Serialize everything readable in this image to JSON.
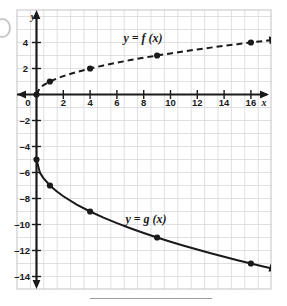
{
  "figure": {
    "kind": "coordinate-grid-graph",
    "background_color": "#ffffff",
    "grid_color": "#c9c9cf",
    "grid_border_color": "#b9b9c2",
    "axis_color": "#1a1a1a",
    "curve_color": "#1a1a1a",
    "point_color": "#1a1a1a"
  },
  "axes": {
    "x_axis_name": "x",
    "y_axis_name": "y",
    "origin_label": "0",
    "x_tick_labels": [
      "2",
      "4",
      "6",
      "8",
      "10",
      "12",
      "14",
      "16"
    ],
    "y_tick_labels": [
      "4",
      "2",
      "–2",
      "–4",
      "–6",
      "–8",
      "–10",
      "–12",
      "–14"
    ]
  },
  "labels": {
    "f_label": "y = f (x)",
    "g_label": "y = g (x)"
  },
  "chart_data": {
    "type": "line",
    "title": "",
    "xlabel": "x",
    "ylabel": "y",
    "xlim": [
      -1,
      18
    ],
    "ylim": [
      -15,
      5
    ],
    "grid": true,
    "legend": "inline-labels",
    "x_ticks": [
      0,
      2,
      4,
      6,
      8,
      10,
      12,
      14,
      16
    ],
    "y_ticks": [
      4,
      2,
      0,
      -2,
      -4,
      -6,
      -8,
      -10,
      -12,
      -14
    ],
    "x_minor_step": 1,
    "y_minor_step": 1,
    "series": [
      {
        "name": "y = f (x)",
        "style": "dashed",
        "equation": "f(x) = sqrt(x)",
        "arrow_end": "right",
        "marked_points": [
          {
            "x": 0,
            "y": 0
          },
          {
            "x": 1,
            "y": 1
          },
          {
            "x": 4,
            "y": 2
          },
          {
            "x": 9,
            "y": 3
          },
          {
            "x": 16,
            "y": 4
          }
        ],
        "x": [
          0,
          0.25,
          0.5,
          1,
          1.5,
          2,
          3,
          4,
          5,
          6,
          7,
          8,
          9,
          10,
          11,
          12,
          13,
          14,
          15,
          16,
          17,
          18
        ],
        "values": [
          0,
          0.5,
          0.707,
          1,
          1.225,
          1.414,
          1.732,
          2,
          2.236,
          2.449,
          2.646,
          2.828,
          3,
          3.162,
          3.317,
          3.464,
          3.606,
          3.742,
          3.873,
          4,
          4.123,
          4.243
        ]
      },
      {
        "name": "y = g (x)",
        "style": "solid",
        "equation": "g(x) = -2*sqrt(x) - 5",
        "arrow_end": "right",
        "marked_points": [
          {
            "x": 0,
            "y": -5
          },
          {
            "x": 1,
            "y": -7
          },
          {
            "x": 4,
            "y": -9
          },
          {
            "x": 9,
            "y": -11
          },
          {
            "x": 16,
            "y": -13
          }
        ],
        "x": [
          0,
          0.25,
          0.5,
          1,
          1.5,
          2,
          3,
          4,
          5,
          6,
          7,
          8,
          9,
          10,
          11,
          12,
          13,
          14,
          15,
          16,
          17,
          18
        ],
        "values": [
          -5,
          -6,
          -6.414,
          -7,
          -7.449,
          -7.828,
          -8.464,
          -9,
          -9.472,
          -9.899,
          -10.292,
          -10.657,
          -11,
          -11.325,
          -11.633,
          -11.928,
          -12.211,
          -12.483,
          -12.746,
          -13,
          -13.246,
          -13.485
        ]
      }
    ]
  }
}
